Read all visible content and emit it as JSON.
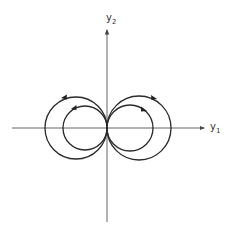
{
  "diagram": {
    "type": "phase-portrait",
    "axes": {
      "horizontal": {
        "label": "y",
        "subscript": "1"
      },
      "vertical": {
        "label": "y",
        "subscript": "2"
      }
    },
    "origin": {
      "x": 107,
      "y": 128
    },
    "curves": [
      {
        "name": "left-outer-orbit",
        "cx": 76,
        "cy": 128,
        "r": 31,
        "direction": "counterclockwise"
      },
      {
        "name": "left-inner-orbit",
        "cx": 85,
        "cy": 128,
        "r": 22,
        "direction": "counterclockwise"
      },
      {
        "name": "right-outer-orbit",
        "cx": 139,
        "cy": 128,
        "r": 32,
        "direction": "clockwise"
      },
      {
        "name": "right-inner-orbit",
        "cx": 130,
        "cy": 128,
        "r": 23,
        "direction": "clockwise"
      }
    ],
    "colors": {
      "stroke": "#2a2a2a",
      "axis": "#555555",
      "background": "#ffffff"
    }
  }
}
